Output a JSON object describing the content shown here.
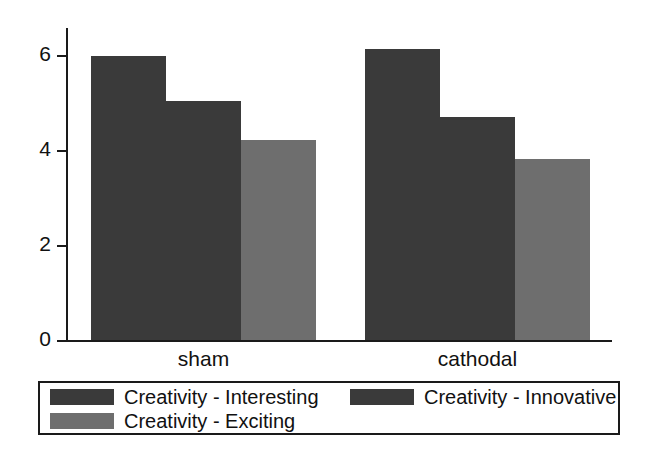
{
  "chart_data": {
    "type": "bar",
    "title": "",
    "subtitle": "",
    "xlabel": "",
    "ylabel": "",
    "categories": [
      "sham",
      "cathodal"
    ],
    "ylim": [
      0,
      6.8
    ],
    "yticks": [
      0,
      2,
      4,
      6
    ],
    "ytick_labels": [
      "0",
      "2",
      "4",
      "6"
    ],
    "grid": false,
    "legend_position": "bottom",
    "series": [
      {
        "name": "Creativity - Interesting",
        "color": "#3a3a3a",
        "values": [
          6.2,
          6.35
        ]
      },
      {
        "name": "Creativity - Innovative",
        "color": "#3a3a3a",
        "values": [
          5.2,
          4.85
        ]
      },
      {
        "name": "Creativity - Exciting",
        "color": "#6e6e6e",
        "values": [
          4.35,
          3.95
        ]
      }
    ]
  },
  "axes": {
    "y_tick_0": "0",
    "y_tick_1": "2",
    "y_tick_2": "4",
    "y_tick_3": "6",
    "x_label_0": "sham",
    "x_label_1": "cathodal"
  },
  "legend": {
    "items": [
      {
        "label": "Creativity - Interesting",
        "color": "#3a3a3a"
      },
      {
        "label": "Creativity - Innovative",
        "color": "#3a3a3a"
      },
      {
        "label": "Creativity - Exciting",
        "color": "#6e6e6e"
      }
    ]
  },
  "colors": {
    "dark_bar": "#3a3a3a",
    "light_bar": "#6e6e6e",
    "axis": "#1a1a1a",
    "background": "#ffffff"
  }
}
